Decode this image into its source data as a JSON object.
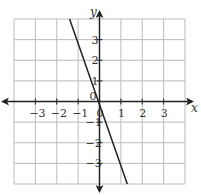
{
  "chart_data": {
    "type": "line",
    "title": "",
    "xlabel": "x",
    "ylabel": "y",
    "xlim": [
      -4,
      4
    ],
    "ylim": [
      -4,
      4
    ],
    "grid": true,
    "x_ticks": [
      "-3",
      "-2",
      "-1",
      "0",
      "1",
      "2",
      "3"
    ],
    "y_ticks": [
      "3",
      "2",
      "1",
      "0",
      "-1",
      "-2",
      "-3"
    ],
    "series": [
      {
        "name": "line",
        "x": [
          -1.4,
          1.3
        ],
        "y": [
          4,
          -4
        ],
        "slope": -3,
        "y_intercept": 0.25
      }
    ]
  }
}
